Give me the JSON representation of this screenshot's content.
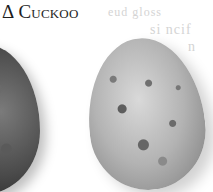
{
  "heading": {
    "symbol": "Δ",
    "title": "Cuckoo"
  },
  "bleed_through_text": [
    "eud gloss",
    "si ncif",
    "n"
  ],
  "images": [
    {
      "name": "dark-egg",
      "description": "Dark mottled egg, cropped at left edge"
    },
    {
      "name": "speckled-egg",
      "description": "Pale egg with dark speckles"
    }
  ]
}
